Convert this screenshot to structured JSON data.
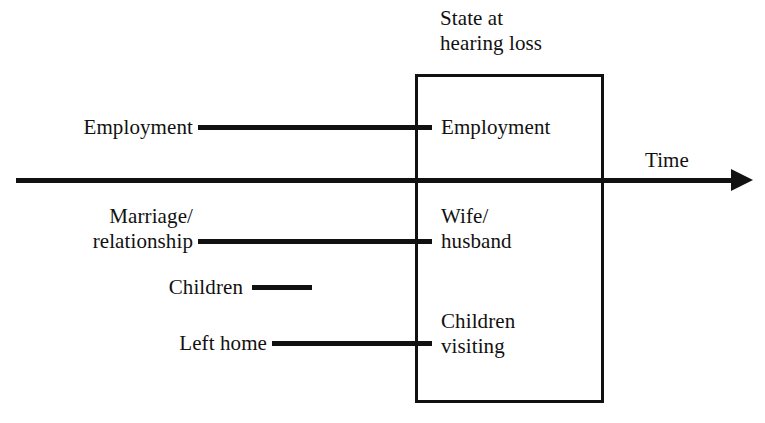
{
  "diagram": {
    "title_caption": "State at hearing loss",
    "axis": {
      "label": "Time",
      "arrow_icon": "arrow-right-icon"
    },
    "state_box": {
      "heading_line_1": "State at",
      "heading_line_2": "hearing loss"
    },
    "rows": [
      {
        "id": "employment",
        "before_label": "Employment",
        "after_label": "Employment",
        "after_label_line_2": "",
        "connector": "timeline-connector"
      },
      {
        "id": "marriage",
        "before_label_line_1": "Marriage/",
        "before_label_line_2": "relationship",
        "after_label_line_1": "Wife/",
        "after_label_line_2": "husband",
        "connector": "timeline-connector"
      },
      {
        "id": "children",
        "before_label": "Children",
        "after_label": "",
        "connector": "timeline-connector-short"
      },
      {
        "id": "left-home",
        "before_label": "Left home",
        "after_label_line_1": "Children",
        "after_label_line_2": "visiting",
        "connector": "timeline-connector"
      }
    ],
    "colors": {
      "ink": "#111111",
      "background": "#ffffff"
    }
  }
}
